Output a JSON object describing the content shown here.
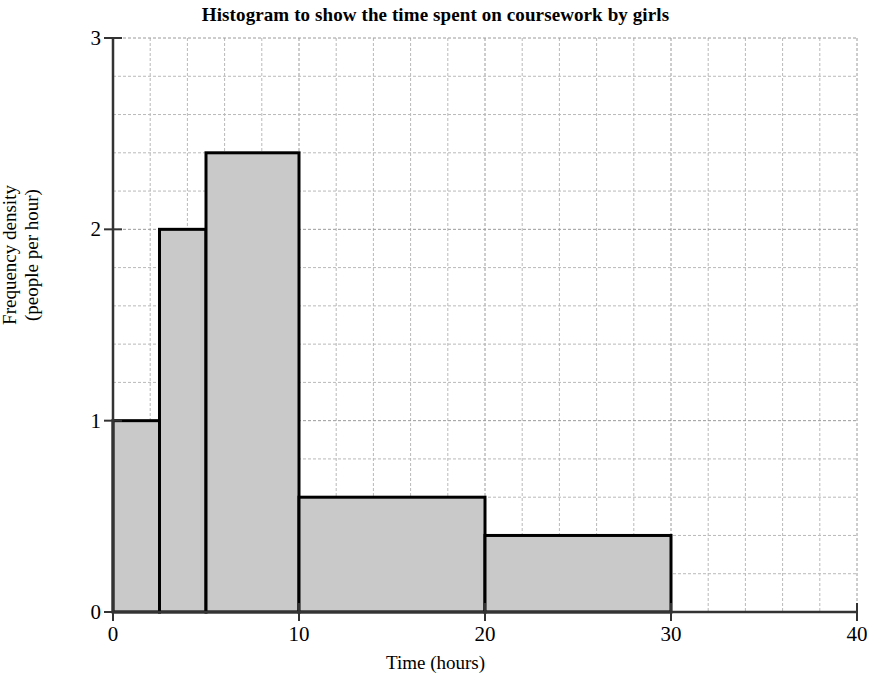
{
  "chart_data": {
    "type": "bar",
    "title": "Histogram to show the time spent on coursework by girls",
    "xlabel": "Time (hours)",
    "ylabel_lines": [
      "Frequency density",
      "(people per hour)"
    ],
    "xlim": [
      0,
      40
    ],
    "ylim": [
      0,
      3
    ],
    "x_ticks": [
      0,
      10,
      20,
      30,
      40
    ],
    "x_tick_labels": [
      "0",
      "10",
      "20",
      "30",
      "40"
    ],
    "y_ticks": [
      0,
      1,
      2,
      3
    ],
    "y_tick_labels": [
      "0",
      "1",
      "2",
      "3"
    ],
    "grid": true,
    "grid_x_step": 2,
    "grid_y_step": 0.2,
    "legend": null,
    "bar_fill_color": "#c9c9c9",
    "bar_edge_color": "#000000",
    "bars": [
      {
        "x_start": 0,
        "x_end": 2.5,
        "frequency_density": 1.0,
        "label": "0 – 2.5"
      },
      {
        "x_start": 2.5,
        "x_end": 5,
        "frequency_density": 2.0,
        "label": "2.5 – 5"
      },
      {
        "x_start": 5,
        "x_end": 10,
        "frequency_density": 2.4,
        "label": "5 – 10"
      },
      {
        "x_start": 10,
        "x_end": 20,
        "frequency_density": 0.6,
        "label": "10 – 20"
      },
      {
        "x_start": 20,
        "x_end": 30,
        "frequency_density": 0.4,
        "label": "20 – 30"
      }
    ]
  }
}
